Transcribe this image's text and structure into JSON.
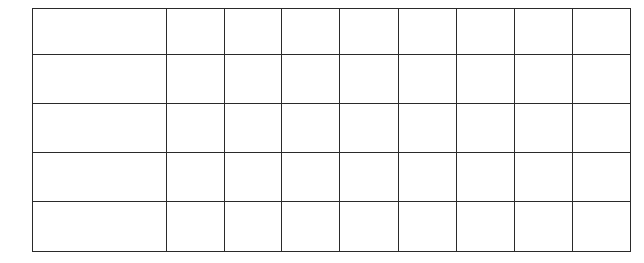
{
  "table": {
    "column_widths": [
      133,
      57,
      56,
      57,
      58,
      57,
      57,
      57,
      57
    ],
    "row_heights": [
      45,
      48,
      48,
      48,
      49
    ],
    "border_color": "#2a2a2a",
    "rows": [
      [
        "",
        "",
        "",
        "",
        "",
        "",
        "",
        "",
        ""
      ],
      [
        "",
        "",
        "",
        "",
        "",
        "",
        "",
        "",
        ""
      ],
      [
        "",
        "",
        "",
        "",
        "",
        "",
        "",
        "",
        ""
      ],
      [
        "",
        "",
        "",
        "",
        "",
        "",
        "",
        "",
        ""
      ],
      [
        "",
        "",
        "",
        "",
        "",
        "",
        "",
        "",
        ""
      ]
    ]
  }
}
